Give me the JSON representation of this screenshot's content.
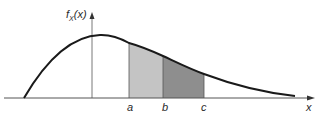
{
  "figure": {
    "type": "probability-density-diagram",
    "y_axis_label": "f",
    "y_axis_subscript": "X",
    "y_axis_arg": "(x)",
    "x_axis_label": "x",
    "points": [
      {
        "name": "a",
        "label": "a"
      },
      {
        "name": "b",
        "label": "b"
      },
      {
        "name": "c",
        "label": "c"
      }
    ],
    "regions": [
      {
        "from": "a",
        "to": "b",
        "fill": "#c4c4c4"
      },
      {
        "from": "b",
        "to": "c",
        "fill": "#8e8e8e"
      }
    ],
    "colors": {
      "curve": "#1a1a1a",
      "axis": "#555555",
      "light_shade": "#c4c4c4",
      "dark_shade": "#8e8e8e"
    },
    "caption": ""
  }
}
